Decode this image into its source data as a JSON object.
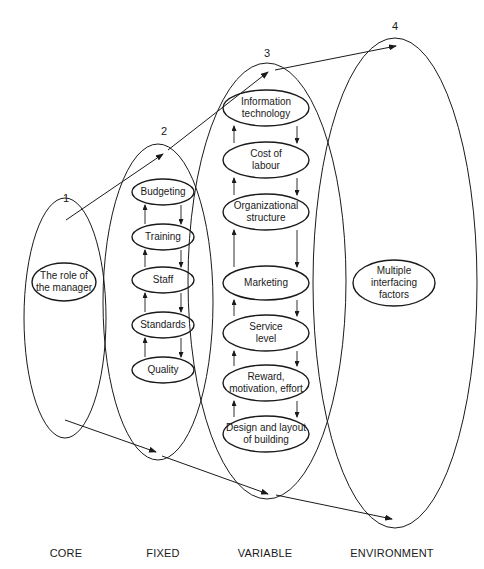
{
  "diagram": {
    "stages": [
      {
        "number": "1",
        "footer": "CORE",
        "items": [
          "The role of\nthe manager"
        ]
      },
      {
        "number": "2",
        "footer": "FIXED",
        "items": [
          "Budgeting",
          "Training",
          "Staff",
          "Standards",
          "Quality"
        ]
      },
      {
        "number": "3",
        "footer": "VARIABLE",
        "items": [
          "Information\ntechnology",
          "Cost of\nlabour",
          "Organizational\nstructure",
          "Marketing",
          "Service\nlevel",
          "Reward,\nmotivation, effort",
          "Design and layout\nof building"
        ]
      },
      {
        "number": "4",
        "footer": "ENVIRONMENT",
        "items": [
          "Multiple\ninterfacing\nfactors"
        ]
      }
    ],
    "line_color": "#1a1a1a"
  }
}
